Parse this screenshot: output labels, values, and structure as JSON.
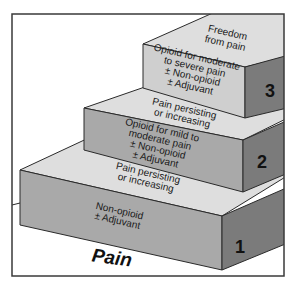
{
  "base_label": "Pain",
  "colors": {
    "frame": "#3a3a3a",
    "top_face": "#dedede",
    "front_face": "#a9a9a9",
    "side_face": "#7b7b7b",
    "outline": "#2a2a2a"
  },
  "steps": [
    {
      "number": "1",
      "lines": [
        "Non-opioid",
        "± Adjuvant"
      ],
      "top_label": [
        "Pain persisting",
        "or increasing"
      ]
    },
    {
      "number": "2",
      "lines": [
        "Opioid for mild to",
        "moderate pain",
        "± Non-opioid",
        "± Adjuvant"
      ],
      "top_label": [
        "Pain persisting",
        "or increasing"
      ]
    },
    {
      "number": "3",
      "lines": [
        "Opioid for moderate",
        "to severe pain",
        "± Non-opioid",
        "± Adjuvant"
      ],
      "top_label": [
        "Freedom",
        "from pain"
      ]
    }
  ]
}
